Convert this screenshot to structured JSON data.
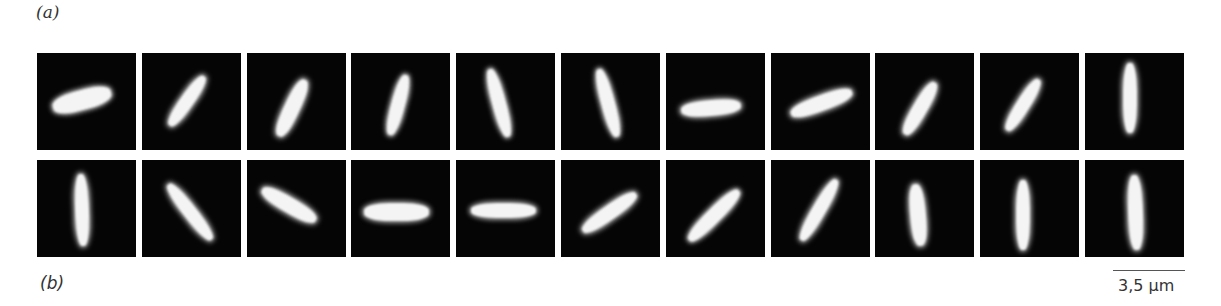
{
  "labels": {
    "a": "(a)",
    "b": "(b)"
  },
  "scale_bar": {
    "text": "3,5 µm"
  },
  "grid": {
    "left": 37,
    "pitch": 104.8,
    "rows_top": [
      53,
      160
    ]
  },
  "rows": [
    [
      {
        "cx": 45,
        "cy": 47,
        "len": 60,
        "w": 20,
        "angle": -15
      },
      {
        "cx": 45,
        "cy": 48,
        "len": 60,
        "w": 14,
        "angle": -55
      },
      {
        "cx": 45,
        "cy": 55,
        "len": 62,
        "w": 16,
        "angle": -65
      },
      {
        "cx": 47,
        "cy": 52,
        "len": 62,
        "w": 14,
        "angle": -75
      },
      {
        "cx": 43,
        "cy": 50,
        "len": 70,
        "w": 14,
        "angle": 75
      },
      {
        "cx": 47,
        "cy": 50,
        "len": 70,
        "w": 14,
        "angle": 75
      },
      {
        "cx": 45,
        "cy": 55,
        "len": 60,
        "w": 16,
        "angle": -5
      },
      {
        "cx": 50,
        "cy": 50,
        "len": 65,
        "w": 16,
        "angle": -20
      },
      {
        "cx": 45,
        "cy": 55,
        "len": 60,
        "w": 15,
        "angle": -60
      },
      {
        "cx": 43,
        "cy": 52,
        "len": 60,
        "w": 14,
        "angle": -58
      },
      {
        "cx": 45,
        "cy": 45,
        "len": 70,
        "w": 14,
        "angle": 90
      }
    ],
    [
      {
        "cx": 45,
        "cy": 50,
        "len": 72,
        "w": 14,
        "angle": 88
      },
      {
        "cx": 48,
        "cy": 52,
        "len": 70,
        "w": 14,
        "angle": 52
      },
      {
        "cx": 42,
        "cy": 45,
        "len": 62,
        "w": 16,
        "angle": 30
      },
      {
        "cx": 45,
        "cy": 52,
        "len": 65,
        "w": 18,
        "angle": 0
      },
      {
        "cx": 47,
        "cy": 50,
        "len": 65,
        "w": 15,
        "angle": 0
      },
      {
        "cx": 48,
        "cy": 52,
        "len": 65,
        "w": 15,
        "angle": -35
      },
      {
        "cx": 48,
        "cy": 55,
        "len": 70,
        "w": 15,
        "angle": -45
      },
      {
        "cx": 48,
        "cy": 50,
        "len": 70,
        "w": 14,
        "angle": -60
      },
      {
        "cx": 43,
        "cy": 55,
        "len": 62,
        "w": 16,
        "angle": 85
      },
      {
        "cx": 43,
        "cy": 55,
        "len": 70,
        "w": 14,
        "angle": 90
      },
      {
        "cx": 50,
        "cy": 52,
        "len": 75,
        "w": 15,
        "angle": 88
      }
    ]
  ]
}
